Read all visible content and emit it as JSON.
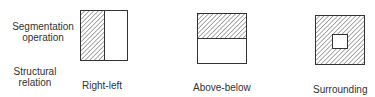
{
  "row_labels": {
    "segmentation": [
      "Segmentation",
      "operation"
    ],
    "structural": [
      "Structural",
      "relation"
    ]
  },
  "figures": [
    {
      "id": "right-left",
      "caption": "Right-left",
      "shaded": "left half"
    },
    {
      "id": "above-below",
      "caption": "Above-below",
      "shaded": "top half"
    },
    {
      "id": "surrounding",
      "caption": "Surrounding",
      "shaded": "outer frame around inner square"
    }
  ],
  "colors": {
    "stroke": "#333333",
    "hatch": "#555555",
    "background": "#ffffff"
  }
}
